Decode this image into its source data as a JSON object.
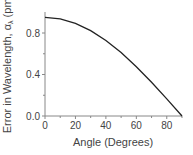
{
  "chart_data": {
    "type": "line",
    "title": "",
    "xlabel": "Angle (Degrees)",
    "ylabel": "Error in Wavelength, αλ (pm)",
    "xlim": [
      0,
      90
    ],
    "ylim": [
      0,
      1.0
    ],
    "x_ticks": [
      0,
      20,
      40,
      60,
      80
    ],
    "y_ticks": [
      0.0,
      0.4,
      0.8
    ],
    "x_tick_labels": [
      "0",
      "20",
      "40",
      "60",
      "80"
    ],
    "y_tick_labels": [
      "0.0",
      "0.4",
      "0.8"
    ],
    "grid": false,
    "legend": null,
    "series": [
      {
        "name": "Error in Wavelength",
        "x": [
          0,
          10,
          20,
          30,
          40,
          50,
          60,
          70,
          80,
          90
        ],
        "values": [
          0.95,
          0.936,
          0.893,
          0.823,
          0.728,
          0.611,
          0.475,
          0.325,
          0.165,
          0.0
        ]
      }
    ]
  },
  "colors": {
    "line": "#222222",
    "axis": "#888888",
    "text": "#444444"
  }
}
